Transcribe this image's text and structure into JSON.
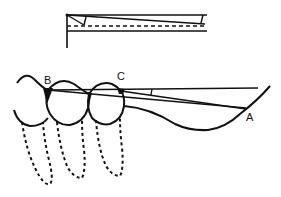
{
  "diagram": {
    "labels": {
      "a": "A",
      "b": "B",
      "c": "C"
    },
    "colors": {
      "ink": "#111111",
      "background": "#ffffff"
    }
  }
}
